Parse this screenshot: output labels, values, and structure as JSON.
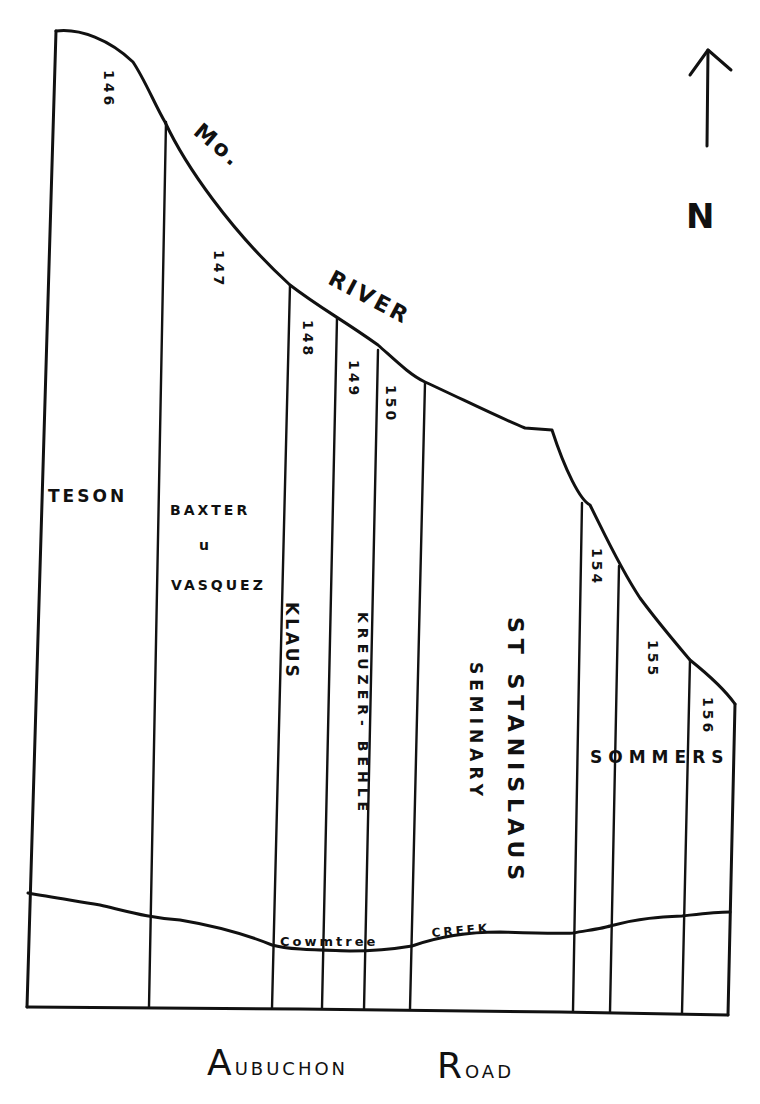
{
  "map": {
    "north_arrow": {
      "label": "N",
      "icon": "north-arrow-icon"
    },
    "river": {
      "label_part1": "Mo.",
      "label_part2": "River"
    },
    "creek": {
      "label_part1": "Cowmtree",
      "label_part2": "Creek"
    },
    "road": {
      "label_word1_initial": "A",
      "label_word1_rest": "ubuchon",
      "label_word2_initial": "R",
      "label_word2_rest": "oad"
    },
    "lot_numbers": [
      "146",
      "147",
      "148",
      "149",
      "150",
      "154",
      "155",
      "156"
    ],
    "owners": [
      {
        "name": "Teson"
      },
      {
        "name_line1": "Baxter",
        "name_line2": "u",
        "name_line3": "Vasquez"
      },
      {
        "name": "Klaus"
      },
      {
        "name": "Kreuzer- Behle"
      },
      {
        "name_line1": "St Stanislaus",
        "name_line2": "Seminary"
      },
      {
        "name": "Sommers"
      }
    ],
    "colors": {
      "ink": "#111111",
      "paper": "#ffffff"
    }
  }
}
